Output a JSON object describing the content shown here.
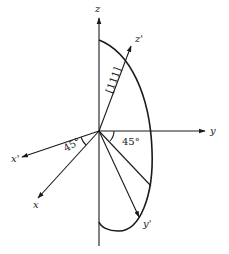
{
  "diagram": {
    "axes": {
      "z": "z",
      "y": "y",
      "x": "x",
      "x_prime": "x'",
      "y_prime": "y'",
      "z_prime": "z'"
    },
    "direction_label": "[111]",
    "angles": {
      "xy_plane": "45°",
      "x_rotation": "45°"
    },
    "colors": {
      "ink": "#1a1a1a",
      "background": "#ffffff"
    }
  }
}
